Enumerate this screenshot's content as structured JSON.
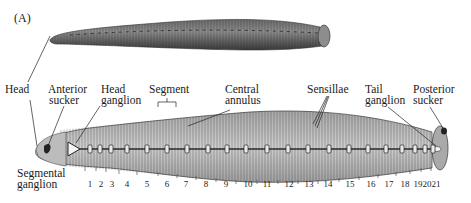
{
  "panel_label": "(A)",
  "labels": {
    "head": "Head",
    "anterior_sucker": [
      "Anterior",
      "sucker"
    ],
    "head_ganglion": [
      "Head",
      "ganglion"
    ],
    "segment": "Segment",
    "central_annulus": [
      "Central",
      "annulus"
    ],
    "sensillae": "Sensillae",
    "tail_ganglion": [
      "Tail",
      "ganglion"
    ],
    "posterior_sucker": [
      "Posterior",
      "sucker"
    ],
    "segmental_ganglion": [
      "Segmental",
      "ganglion"
    ]
  },
  "segment_numbers": [
    {
      "n": "1",
      "x": 90
    },
    {
      "n": "2",
      "x": 101
    },
    {
      "n": "3",
      "x": 112
    },
    {
      "n": "4",
      "x": 127
    },
    {
      "n": "5",
      "x": 147
    },
    {
      "n": "6",
      "x": 167
    },
    {
      "n": "7",
      "x": 186
    },
    {
      "n": "8",
      "x": 206
    },
    {
      "n": "9",
      "x": 226
    },
    {
      "n": "10",
      "x": 248
    },
    {
      "n": "11",
      "x": 267
    },
    {
      "n": "12",
      "x": 289
    },
    {
      "n": "13",
      "x": 309
    },
    {
      "n": "14",
      "x": 328
    },
    {
      "n": "15",
      "x": 350
    },
    {
      "n": "16",
      "x": 371
    },
    {
      "n": "17",
      "x": 389
    },
    {
      "n": "18",
      "x": 405
    },
    {
      "n": "19",
      "x": 418
    },
    {
      "n": "20",
      "x": 427
    },
    {
      "n": "21",
      "x": 436
    }
  ],
  "colors": {
    "body_top": "#8a8a8a",
    "body_dark": "#4a4a4a",
    "body_ventral": "#bdbdbd",
    "ink": "#1a1a1a"
  }
}
